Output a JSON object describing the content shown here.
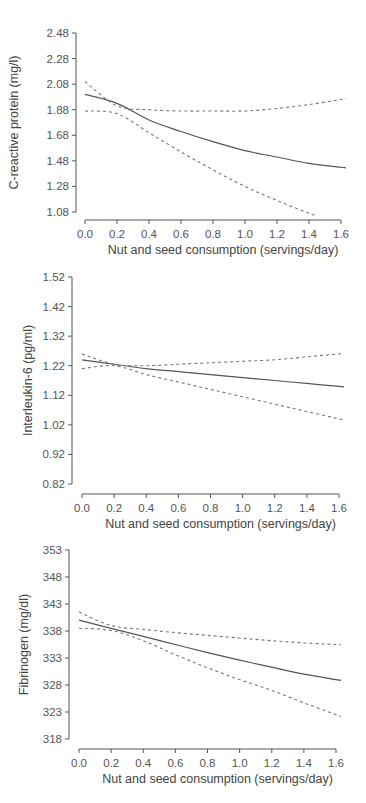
{
  "colors": {
    "background": "#ffffff",
    "line": "#555555",
    "ci": "#777777",
    "text": "#555555"
  },
  "chart_data": [
    {
      "type": "line",
      "title": "",
      "xlabel": "Nut and seed consumption (servings/day)",
      "ylabel": "C-reactive protein (mg/l)",
      "x_ticks": [
        "0.0",
        "0.2",
        "0.4",
        "0.6",
        "0.8",
        "1.0",
        "1.2",
        "1.4",
        "1.6"
      ],
      "y_ticks": [
        "2.48",
        "2.28",
        "2.08",
        "1.88",
        "1.68",
        "1.48",
        "1.28",
        "1.08"
      ],
      "xlim": [
        0.0,
        1.6
      ],
      "ylim": [
        1.08,
        2.48
      ],
      "grid": false,
      "legend": "none",
      "x": [
        0.0,
        0.2,
        0.4,
        0.6,
        0.8,
        1.0,
        1.2,
        1.4,
        1.6
      ],
      "series": [
        {
          "name": "Estimate",
          "style": "solid",
          "values": [
            2.0,
            1.93,
            1.8,
            1.71,
            1.63,
            1.56,
            1.51,
            1.46,
            1.43
          ]
        },
        {
          "name": "Upper 95% CI",
          "style": "dashed",
          "values": [
            2.1,
            1.91,
            1.88,
            1.87,
            1.87,
            1.87,
            1.89,
            1.92,
            1.96
          ]
        },
        {
          "name": "Lower 95% CI",
          "style": "dashed",
          "values": [
            1.87,
            1.85,
            1.7,
            1.55,
            1.41,
            1.28,
            1.17,
            1.07,
            0.98
          ]
        }
      ]
    },
    {
      "type": "line",
      "title": "",
      "xlabel": "Nut and seed consumption (servings/day)",
      "ylabel": "Interleukin-6 (pg/ml)",
      "x_ticks": [
        "0.0",
        "0.2",
        "0.4",
        "0.6",
        "0.8",
        "1.0",
        "1.2",
        "1.4",
        "1.6"
      ],
      "y_ticks": [
        "1.52",
        "1.42",
        "1.32",
        "1.22",
        "1.12",
        "1.02",
        "0.92",
        "0.82"
      ],
      "xlim": [
        0.0,
        1.6
      ],
      "ylim": [
        0.82,
        1.52
      ],
      "grid": false,
      "legend": "none",
      "x": [
        0.0,
        0.2,
        0.4,
        0.6,
        0.8,
        1.0,
        1.2,
        1.4,
        1.6
      ],
      "series": [
        {
          "name": "Estimate",
          "style": "solid",
          "values": [
            1.24,
            1.225,
            1.21,
            1.2,
            1.19,
            1.18,
            1.17,
            1.16,
            1.15
          ]
        },
        {
          "name": "Upper 95% CI",
          "style": "dashed",
          "values": [
            1.26,
            1.225,
            1.22,
            1.225,
            1.23,
            1.235,
            1.24,
            1.25,
            1.26
          ]
        },
        {
          "name": "Lower 95% CI",
          "style": "dashed",
          "values": [
            1.21,
            1.22,
            1.19,
            1.165,
            1.14,
            1.115,
            1.09,
            1.065,
            1.04
          ]
        }
      ]
    },
    {
      "type": "line",
      "title": "",
      "xlabel": "Nut and seed consumption (servings/day)",
      "ylabel": "Fibrinogen (mg/dl)",
      "x_ticks": [
        "0.0",
        "0.2",
        "0.4",
        "0.6",
        "0.8",
        "1.0",
        "1.2",
        "1.4",
        "1.6"
      ],
      "y_ticks": [
        "353",
        "348",
        "343",
        "338",
        "333",
        "328",
        "323",
        "318"
      ],
      "xlim": [
        0.0,
        1.6
      ],
      "ylim": [
        318,
        353
      ],
      "grid": false,
      "legend": "none",
      "x": [
        0.0,
        0.2,
        0.4,
        0.6,
        0.8,
        1.0,
        1.2,
        1.4,
        1.6
      ],
      "series": [
        {
          "name": "Estimate",
          "style": "solid",
          "values": [
            340.0,
            338.5,
            337.0,
            335.5,
            334.0,
            332.6,
            331.3,
            330.0,
            329.0
          ]
        },
        {
          "name": "Upper 95% CI",
          "style": "dashed",
          "values": [
            341.5,
            339.0,
            338.3,
            337.7,
            337.2,
            336.7,
            336.2,
            335.8,
            335.5
          ]
        },
        {
          "name": "Lower 95% CI",
          "style": "dashed",
          "values": [
            338.5,
            338.1,
            336.2,
            333.6,
            331.2,
            329.0,
            327.0,
            324.7,
            322.5
          ]
        }
      ]
    }
  ]
}
